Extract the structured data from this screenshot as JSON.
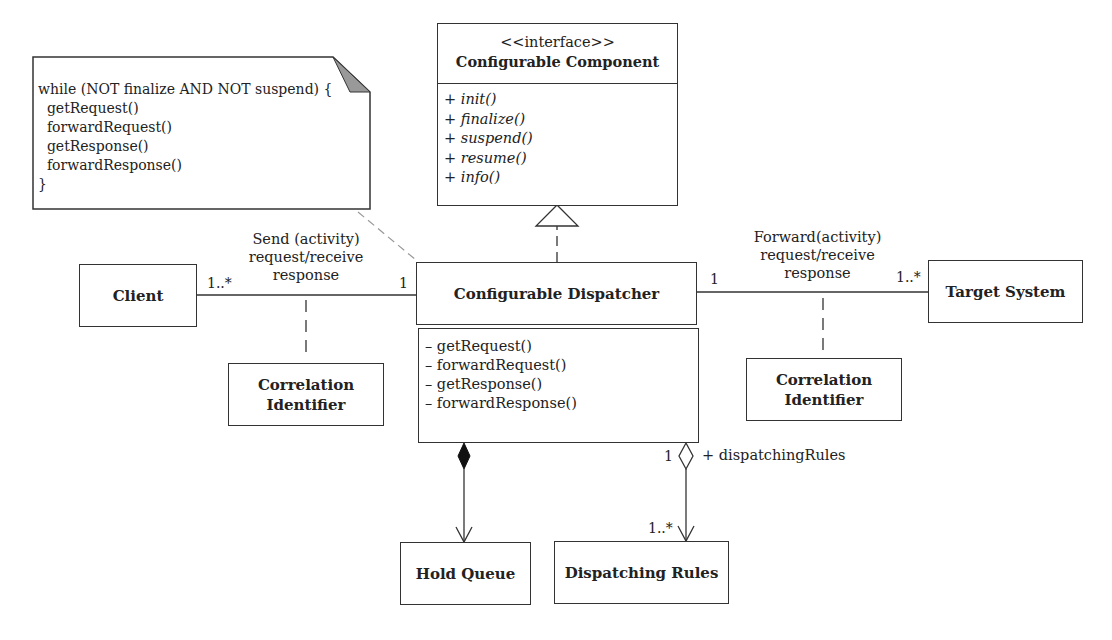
{
  "note": {
    "lines": [
      "while (NOT finalize AND NOT suspend) {",
      "  getRequest()",
      "  forwardRequest()",
      "  getResponse()",
      "  forwardResponse()",
      "}"
    ]
  },
  "interface": {
    "stereotype": "<<interface>>",
    "name": "Configurable Component",
    "operations": [
      "+ init()",
      "+ finalize()",
      "+ suspend()",
      "+ resume()",
      "+ info()"
    ]
  },
  "dispatcher": {
    "name": "Configurable Dispatcher",
    "operations": [
      "– getRequest()",
      "– forwardRequest()",
      "– getResponse()",
      "– forwardResponse()"
    ]
  },
  "client": {
    "name": "Client"
  },
  "target": {
    "name": "Target System"
  },
  "correlation_left": {
    "line1": "Correlation",
    "line2": "Identifier"
  },
  "correlation_right": {
    "line1": "Correlation",
    "line2": "Identifier"
  },
  "hold_queue": {
    "name": "Hold Queue"
  },
  "dispatching_rules": {
    "name": "Dispatching Rules"
  },
  "assoc_left": {
    "line1": "Send (activity)",
    "line2": "request/receive",
    "line3": "response",
    "mult_client": "1..*",
    "mult_dispatcher": "1"
  },
  "assoc_right": {
    "line1": "Forward(activity)",
    "line2": "request/receive",
    "line3": "response",
    "mult_dispatcher": "1",
    "mult_target": "1..*"
  },
  "aggregation": {
    "role": "+ dispatchingRules",
    "mult_source": "1",
    "mult_target": "1..*"
  }
}
